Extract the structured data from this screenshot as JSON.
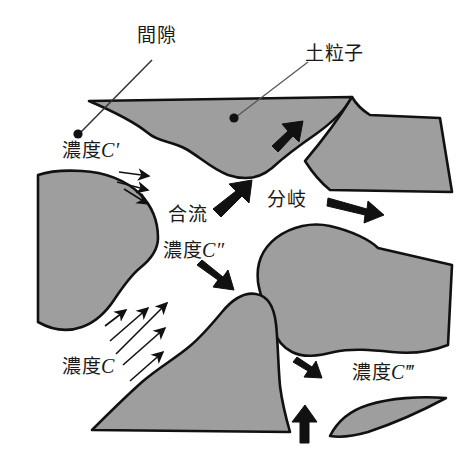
{
  "figure": {
    "colors": {
      "particle_fill": "#9e9e9e",
      "particle_stroke": "#111111",
      "arrow": "#111111",
      "background": "#ffffff",
      "text": "#1a1a1a"
    }
  },
  "labels": {
    "pore": "間隙",
    "soil_particle": "土粒子",
    "concentration_c_prime": "濃度C′",
    "confluence": "合流",
    "concentration_c_double_prime": "濃度C″",
    "branching": "分岐",
    "concentration_c": "濃度C",
    "concentration_c_triple_prime": "濃度C‴"
  },
  "label_parts": {
    "conc_word": "濃度",
    "c_symbol": "C",
    "prime_1": "′",
    "prime_2": "″",
    "prime_3": "‴"
  },
  "callouts": [
    {
      "name": "pore-callout",
      "label": "間隙",
      "dot_x": 78,
      "dot_y": 134,
      "text_x": 140,
      "text_y": 35
    },
    {
      "name": "soil-particle-callout",
      "label": "土粒子",
      "dot_x": 234,
      "dot_y": 118,
      "text_x": 308,
      "text_y": 52
    }
  ],
  "flow_arrows": {
    "inflow_upper": {
      "count": 3,
      "direction": "down-right",
      "style": "thin",
      "near_label": "濃度C′"
    },
    "inflow_lower": {
      "count": 5,
      "direction": "up-right",
      "style": "thin",
      "near_label": "濃度C"
    },
    "merge_out": {
      "count": 1,
      "direction": "up-right",
      "style": "thick",
      "near_label": "合流"
    },
    "split_down": {
      "count": 1,
      "direction": "down-right",
      "style": "thick",
      "near_label": "濃度C″"
    },
    "split_upper_right": {
      "count": 1,
      "direction": "up-right",
      "style": "thick"
    },
    "split_right": {
      "count": 1,
      "direction": "right-down",
      "style": "thick",
      "near_label": "分岐"
    },
    "outflow_lower_right": {
      "count": 1,
      "direction": "down-right",
      "style": "thick"
    },
    "outflow_bottom": {
      "count": 1,
      "direction": "up",
      "style": "thick"
    }
  }
}
